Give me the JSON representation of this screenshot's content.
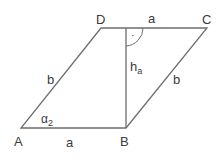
{
  "diagram": {
    "vertices": {
      "A": {
        "label": "A",
        "x": 21,
        "y": 128
      },
      "B": {
        "label": "B",
        "x": 126,
        "y": 128
      },
      "C": {
        "label": "C",
        "x": 207,
        "y": 28
      },
      "D": {
        "label": "D",
        "x": 101,
        "y": 28
      }
    },
    "side_labels": {
      "AB": "a",
      "DC": "a",
      "AD": "b",
      "BC": "b"
    },
    "height": {
      "label": "h",
      "subscript": "a"
    },
    "angle": {
      "label": "α",
      "subscript": "2"
    },
    "right_angle_marker": "·",
    "colors": {
      "line": "#6e6e6e",
      "text": "#3a3a3a"
    }
  }
}
